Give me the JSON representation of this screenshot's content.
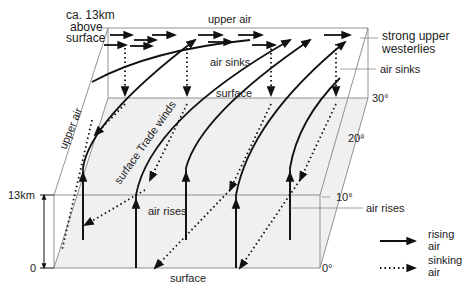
{
  "diagram": {
    "labels": {
      "height_top": "ca. 13km",
      "height_top_2": "above",
      "height_top_3": "surface",
      "upper_air_top": "upper air",
      "upper_air_side": "upper air",
      "air_sinks_mid": "air sinks",
      "surface_mid": "surface",
      "trade_winds": "surface Trade winds",
      "air_rises_mid": "air rises",
      "surface_bottom": "surface",
      "strong_upper_1": "strong upper",
      "strong_upper_2": "westerlies",
      "air_sinks_right": "air sinks",
      "air_rises_right": "air rises",
      "height_scale_top": "13km",
      "height_scale_bottom": "0"
    },
    "latitudes": [
      "30°",
      "20°",
      "10°",
      "0°"
    ],
    "legend": [
      {
        "style": "solid",
        "label_1": "rising",
        "label_2": "air"
      },
      {
        "style": "dotted",
        "label_1": "sinking",
        "label_2": "air"
      }
    ],
    "colors": {
      "line": "#111111",
      "surface_fill": "#f0f0f0",
      "frame": "#666666"
    }
  }
}
